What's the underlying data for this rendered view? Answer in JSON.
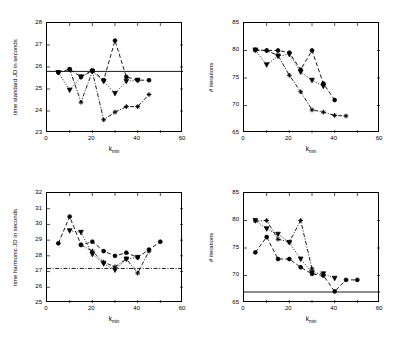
{
  "figure": {
    "background": "#ffffff",
    "foreground": "#000000",
    "panel_count": 4
  },
  "chart_data": [
    {
      "id": "top-left",
      "type": "line",
      "title": "",
      "xlabel": "k_min",
      "ylabel": "time standard JD in seconds",
      "xlim": [
        0,
        60
      ],
      "ylim": [
        23,
        28
      ],
      "xticks": [
        0,
        20,
        40,
        60
      ],
      "xticklabels": [
        "0",
        "20",
        "40",
        "60"
      ],
      "xminorticks": [
        10,
        30,
        50
      ],
      "yticks": [
        23,
        24,
        25,
        26,
        27,
        28
      ],
      "yticklabels": [
        "23",
        "24",
        "25",
        "26",
        "27",
        "28"
      ],
      "grid": false,
      "legend": "none",
      "hline": 25.8,
      "hline_style": "solid",
      "series": [
        {
          "name": "series-a",
          "marker": "circle",
          "line": "dashed",
          "x": [
            5,
            10,
            15,
            20,
            25,
            30,
            35,
            40,
            45
          ],
          "y": [
            25.75,
            25.9,
            25.55,
            25.85,
            25.4,
            27.2,
            25.55,
            25.4,
            25.4
          ]
        },
        {
          "name": "series-b",
          "marker": "triangle-down",
          "line": "dotted",
          "x": [
            5,
            10,
            15,
            20,
            25,
            30,
            35,
            40
          ],
          "y": [
            25.75,
            24.95,
            25.55,
            25.8,
            25.35,
            24.8,
            25.35,
            25.4
          ]
        },
        {
          "name": "series-c",
          "marker": "plus",
          "line": "dashdot",
          "x": [
            10,
            15,
            20,
            25,
            30,
            35,
            40,
            45
          ],
          "y": [
            25.9,
            24.4,
            25.8,
            23.6,
            23.95,
            24.2,
            24.2,
            24.75
          ]
        }
      ]
    },
    {
      "id": "top-right",
      "type": "line",
      "title": "",
      "xlabel": "k_min",
      "ylabel": "# iterations",
      "xlim": [
        0,
        60
      ],
      "ylim": [
        65,
        85
      ],
      "xticks": [
        0,
        20,
        40,
        60
      ],
      "xticklabels": [
        "0",
        "20",
        "40",
        "60"
      ],
      "xminorticks": [
        10,
        30,
        50
      ],
      "yticks": [
        65,
        70,
        75,
        80,
        85
      ],
      "yticklabels": [
        "65",
        "70",
        "75",
        "80",
        "85"
      ],
      "grid": false,
      "legend": "none",
      "hline": null,
      "hline_style": "none",
      "series": [
        {
          "name": "series-a",
          "marker": "circle",
          "line": "dashed",
          "x": [
            5,
            10,
            15,
            20,
            25,
            30,
            35,
            40
          ],
          "y": [
            80.1,
            80.0,
            80.0,
            79.6,
            76.5,
            80.0,
            74.0,
            71.0
          ]
        },
        {
          "name": "series-b",
          "marker": "triangle-down",
          "line": "dotted",
          "x": [
            5,
            10,
            15,
            20,
            25,
            30,
            35
          ],
          "y": [
            80.1,
            77.4,
            79.0,
            79.3,
            76.1,
            74.6,
            73.5
          ]
        },
        {
          "name": "series-c",
          "marker": "plus",
          "line": "dashdot",
          "x": [
            5,
            10,
            15,
            20,
            25,
            30,
            35,
            40,
            45
          ],
          "y": [
            80.1,
            80.0,
            79.1,
            75.5,
            72.5,
            69.2,
            68.8,
            68.2,
            68.1
          ]
        }
      ]
    },
    {
      "id": "bottom-left",
      "type": "line",
      "title": "",
      "xlabel": "k_min",
      "ylabel": "time harmonic JD in seconds",
      "xlim": [
        0,
        60
      ],
      "ylim": [
        25,
        32
      ],
      "xticks": [
        0,
        20,
        40,
        60
      ],
      "xticklabels": [
        "0",
        "20",
        "40",
        "60"
      ],
      "xminorticks": [
        10,
        30,
        50
      ],
      "yticks": [
        25,
        26,
        27,
        28,
        29,
        30,
        31,
        32
      ],
      "yticklabels": [
        "25",
        "26",
        "27",
        "28",
        "29",
        "30",
        "31",
        "32"
      ],
      "grid": false,
      "legend": "none",
      "hline": 27.2,
      "hline_style": "dashdot",
      "series": [
        {
          "name": "series-a",
          "marker": "circle",
          "line": "dashed",
          "x": [
            5,
            10,
            15,
            20,
            25,
            30,
            35,
            40,
            45,
            50
          ],
          "y": [
            28.8,
            30.5,
            28.7,
            28.9,
            28.3,
            28.0,
            28.2,
            27.9,
            28.4,
            28.9
          ]
        },
        {
          "name": "series-b",
          "marker": "triangle-down",
          "line": "dotted",
          "x": [
            10,
            15,
            20,
            25,
            30,
            35,
            40
          ],
          "y": [
            29.6,
            29.5,
            28.1,
            27.5,
            27.1,
            27.8,
            27.9
          ]
        },
        {
          "name": "series-c",
          "marker": "plus",
          "line": "dashdot",
          "x": [
            15,
            20,
            25,
            30,
            35,
            40,
            45
          ],
          "y": [
            28.7,
            28.3,
            27.6,
            27.3,
            27.8,
            26.9,
            28.3
          ]
        }
      ]
    },
    {
      "id": "bottom-right",
      "type": "line",
      "title": "",
      "xlabel": "k_min",
      "ylabel": "# iterations",
      "xlim": [
        0,
        60
      ],
      "ylim": [
        65,
        85
      ],
      "xticks": [
        0,
        20,
        40,
        60
      ],
      "xticklabels": [
        "0",
        "20",
        "40",
        "60"
      ],
      "xminorticks": [
        10,
        30,
        50
      ],
      "yticks": [
        65,
        70,
        75,
        80,
        85
      ],
      "yticklabels": [
        "65",
        "70",
        "75",
        "80",
        "85"
      ],
      "grid": false,
      "legend": "none",
      "hline": 67.0,
      "hline_style": "solid",
      "series": [
        {
          "name": "series-a",
          "marker": "circle",
          "line": "dashed",
          "x": [
            5,
            10,
            15,
            20,
            25,
            30,
            35,
            40,
            45,
            50
          ],
          "y": [
            74.2,
            77.0,
            73.0,
            73.0,
            71.5,
            70.3,
            70.0,
            67.1,
            69.2,
            69.2
          ]
        },
        {
          "name": "series-b",
          "marker": "triangle-down",
          "line": "dotted",
          "x": [
            5,
            10,
            15,
            20,
            25,
            30,
            35,
            40
          ],
          "y": [
            80.0,
            78.5,
            77.5,
            76.0,
            73.0,
            70.5,
            70.3,
            69.5
          ]
        },
        {
          "name": "series-c",
          "marker": "plus",
          "line": "dashdot",
          "x": [
            5,
            10,
            15,
            20,
            25,
            30
          ],
          "y": [
            79.9,
            80.0,
            76.6,
            76.1,
            80.0,
            71.2
          ]
        }
      ]
    }
  ]
}
